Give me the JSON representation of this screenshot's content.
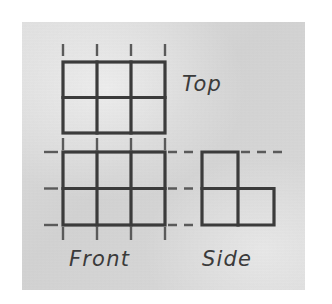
{
  "figure": {
    "kind": "multiview-orthographic-drawing",
    "canvas": {
      "width": 332,
      "height": 304
    },
    "colors": {
      "page_background": "#ffffff",
      "paper_background": "#d8d8d8",
      "line_color": "#3b3b3b",
      "projection_line_color": "#5a5a5a",
      "label_color": "#3b3b3b"
    },
    "paper_panel": {
      "x": 22,
      "y": 22,
      "width": 283,
      "height": 268
    }
  },
  "labels": {
    "top": "Top",
    "front": "Front",
    "side": "Side"
  },
  "views": {
    "top": {
      "name": "top-view",
      "label": "Top",
      "columns": 3,
      "rows": 2,
      "bounds": {
        "x": 63,
        "y": 62,
        "width": 102,
        "height": 71
      },
      "cell_width": 34,
      "cell_height": 35.5,
      "vertical_gridlines_x": [
        63,
        97,
        131,
        165
      ],
      "horizontal_gridlines_y": [
        62,
        97.5,
        133
      ]
    },
    "front": {
      "name": "front-view",
      "label": "Front",
      "columns": 3,
      "rows": 2,
      "bounds": {
        "x": 63,
        "y": 152,
        "width": 102,
        "height": 73
      },
      "cell_width": 34,
      "cell_height": 36.5,
      "vertical_gridlines_x": [
        63,
        97,
        131,
        165
      ],
      "horizontal_gridlines_y": [
        152,
        188.5,
        225
      ]
    },
    "side": {
      "name": "side-view",
      "label": "Side",
      "shape": "L-shape",
      "bounds": {
        "x": 202,
        "y": 152,
        "width": 72,
        "height": 73
      },
      "cell_width": 36,
      "cell_height": 36.5,
      "cells": [
        {
          "col": 0,
          "row": 0,
          "filled": true
        },
        {
          "col": 1,
          "row": 0,
          "filled": false
        },
        {
          "col": 0,
          "row": 1,
          "filled": true
        },
        {
          "col": 1,
          "row": 1,
          "filled": true
        }
      ],
      "outline_points": [
        [
          202,
          152
        ],
        [
          238,
          152
        ],
        [
          238,
          188.5
        ],
        [
          274,
          188.5
        ],
        [
          274,
          225
        ],
        [
          202,
          225
        ]
      ],
      "interior_segments": [
        {
          "x1": 202,
          "y1": 188.5,
          "x2": 238,
          "y2": 188.5
        },
        {
          "x1": 238,
          "y1": 188.5,
          "x2": 238,
          "y2": 225
        }
      ]
    }
  },
  "projection_lines": {
    "vertical_above_top": {
      "count": 4,
      "x": [
        63,
        97,
        131,
        165
      ],
      "y1": 44,
      "y2": 56
    },
    "vertical_between_top_and_front": {
      "count": 4,
      "x": [
        63,
        97,
        131,
        165
      ],
      "y1": 139,
      "y2": 150
    },
    "vertical_below_front": {
      "count": 4,
      "x": [
        63,
        97,
        131,
        165
      ],
      "y1": 227,
      "y2": 240
    },
    "horizontal_left_of_front": {
      "count": 3,
      "y": [
        152,
        188.5,
        225
      ],
      "x1": 44,
      "x2": 58
    },
    "horizontal_front_to_side": {
      "count": 3,
      "y": [
        152,
        188.5,
        225
      ],
      "x1": 168,
      "x2": 200
    },
    "horizontal_right_of_side_top": {
      "count": 1,
      "y": [
        152
      ],
      "x1": 241,
      "x2": 288
    }
  },
  "stroke_widths": {
    "solid_object_line": 3.2,
    "projection_dash": 2.4
  },
  "dash_pattern": {
    "projection": "9 7"
  }
}
